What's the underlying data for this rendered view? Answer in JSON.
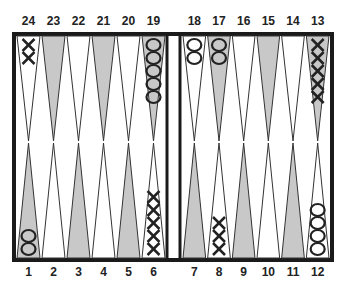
{
  "board": {
    "colors": {
      "border": "#1a1a1a",
      "shaded_point": "#c8c8c8",
      "light_point": "#ffffff",
      "checker_stroke": "#222222"
    },
    "top_labels": [
      "24",
      "23",
      "22",
      "21",
      "20",
      "19",
      "18",
      "17",
      "16",
      "15",
      "14",
      "13"
    ],
    "bottom_labels": [
      "1",
      "2",
      "3",
      "4",
      "5",
      "6",
      "7",
      "8",
      "9",
      "10",
      "11",
      "12"
    ],
    "points": [
      {
        "point": 1,
        "player": "O",
        "count": 2,
        "shaded": true
      },
      {
        "point": 2,
        "player": "",
        "count": 0,
        "shaded": false
      },
      {
        "point": 3,
        "player": "",
        "count": 0,
        "shaded": true
      },
      {
        "point": 4,
        "player": "",
        "count": 0,
        "shaded": false
      },
      {
        "point": 5,
        "player": "",
        "count": 0,
        "shaded": true
      },
      {
        "point": 6,
        "player": "X",
        "count": 5,
        "shaded": false
      },
      {
        "point": 7,
        "player": "",
        "count": 0,
        "shaded": true
      },
      {
        "point": 8,
        "player": "X",
        "count": 3,
        "shaded": false
      },
      {
        "point": 9,
        "player": "",
        "count": 0,
        "shaded": true
      },
      {
        "point": 10,
        "player": "",
        "count": 0,
        "shaded": false
      },
      {
        "point": 11,
        "player": "",
        "count": 0,
        "shaded": true
      },
      {
        "point": 12,
        "player": "O",
        "count": 4,
        "shaded": false
      },
      {
        "point": 13,
        "player": "X",
        "count": 5,
        "shaded": true
      },
      {
        "point": 14,
        "player": "",
        "count": 0,
        "shaded": false
      },
      {
        "point": 15,
        "player": "",
        "count": 0,
        "shaded": true
      },
      {
        "point": 16,
        "player": "",
        "count": 0,
        "shaded": false
      },
      {
        "point": 17,
        "player": "O",
        "count": 2,
        "shaded": true
      },
      {
        "point": 18,
        "player": "O",
        "count": 2,
        "shaded": false
      },
      {
        "point": 19,
        "player": "O",
        "count": 5,
        "shaded": true
      },
      {
        "point": 20,
        "player": "",
        "count": 0,
        "shaded": false
      },
      {
        "point": 21,
        "player": "",
        "count": 0,
        "shaded": true
      },
      {
        "point": 22,
        "player": "",
        "count": 0,
        "shaded": false
      },
      {
        "point": 23,
        "player": "",
        "count": 0,
        "shaded": true
      },
      {
        "point": 24,
        "player": "X",
        "count": 2,
        "shaded": false
      }
    ]
  }
}
